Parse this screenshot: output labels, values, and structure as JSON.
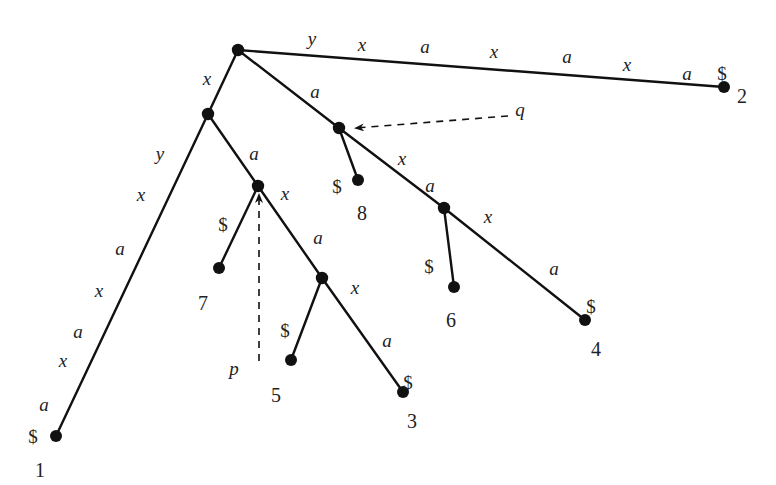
{
  "diagram": {
    "type": "suffix-tree",
    "string": "xaxaxa$ / yxaxaxa$",
    "nodes": [
      {
        "id": "root",
        "x": 238,
        "y": 50,
        "kind": "internal"
      },
      {
        "id": "nx",
        "x": 208,
        "y": 114,
        "kind": "internal"
      },
      {
        "id": "q",
        "x": 339,
        "y": 128,
        "kind": "internal"
      },
      {
        "id": "p",
        "x": 258,
        "y": 186,
        "kind": "internal"
      },
      {
        "id": "nxaxa",
        "x": 322,
        "y": 278,
        "kind": "internal"
      },
      {
        "id": "naxa",
        "x": 444,
        "y": 208,
        "kind": "internal"
      },
      {
        "id": "leaf1",
        "x": 56,
        "y": 436,
        "kind": "leaf",
        "label": "1",
        "lx": 40,
        "ly": 470
      },
      {
        "id": "leaf2",
        "x": 724,
        "y": 87,
        "kind": "leaf",
        "label": "2",
        "lx": 742,
        "ly": 96
      },
      {
        "id": "leaf3",
        "x": 403,
        "y": 392,
        "kind": "leaf",
        "label": "3",
        "lx": 412,
        "ly": 421
      },
      {
        "id": "leaf4",
        "x": 585,
        "y": 320,
        "kind": "leaf",
        "label": "4",
        "lx": 596,
        "ly": 349
      },
      {
        "id": "leaf5",
        "x": 291,
        "y": 360,
        "kind": "leaf",
        "label": "5",
        "lx": 276,
        "ly": 395
      },
      {
        "id": "leaf6",
        "x": 454,
        "y": 287,
        "kind": "leaf",
        "label": "6",
        "lx": 451,
        "ly": 320
      },
      {
        "id": "leaf7",
        "x": 219,
        "y": 268,
        "kind": "leaf",
        "label": "7",
        "lx": 203,
        "ly": 303
      },
      {
        "id": "leaf8",
        "x": 358,
        "y": 180,
        "kind": "leaf",
        "label": "8",
        "lx": 362,
        "ly": 213
      }
    ],
    "edges": [
      {
        "from": "root",
        "to": "nx",
        "label": "x"
      },
      {
        "from": "root",
        "to": "leaf2",
        "label": "yxaxaxa$"
      },
      {
        "from": "root",
        "to": "q",
        "label": "a"
      },
      {
        "from": "nx",
        "to": "leaf1",
        "label": "yxaxaxa$"
      },
      {
        "from": "nx",
        "to": "p",
        "label": "a"
      },
      {
        "from": "p",
        "to": "leaf7",
        "label": "$"
      },
      {
        "from": "p",
        "to": "nxaxa",
        "label": "xa"
      },
      {
        "from": "nxaxa",
        "to": "leaf5",
        "label": "$"
      },
      {
        "from": "nxaxa",
        "to": "leaf3",
        "label": "xa$"
      },
      {
        "from": "q",
        "to": "leaf8",
        "label": "$"
      },
      {
        "from": "q",
        "to": "naxa",
        "label": "xa"
      },
      {
        "from": "naxa",
        "to": "leaf6",
        "label": "$"
      },
      {
        "from": "naxa",
        "to": "leaf4",
        "label": "xa$"
      }
    ],
    "edge_chars": [
      {
        "t": "y",
        "x": 312,
        "y": 38,
        "style": "it"
      },
      {
        "t": "x",
        "x": 362,
        "y": 44,
        "style": "it"
      },
      {
        "t": "a",
        "x": 425,
        "y": 46,
        "style": "it"
      },
      {
        "t": "x",
        "x": 494,
        "y": 51,
        "style": "it"
      },
      {
        "t": "a",
        "x": 567,
        "y": 56,
        "style": "it"
      },
      {
        "t": "x",
        "x": 627,
        "y": 64,
        "style": "it"
      },
      {
        "t": "a",
        "x": 687,
        "y": 73,
        "style": "it"
      },
      {
        "t": "$",
        "x": 722,
        "y": 73,
        "style": "rm"
      },
      {
        "t": "x",
        "x": 207,
        "y": 78,
        "style": "it"
      },
      {
        "t": "a",
        "x": 315,
        "y": 91,
        "style": "it"
      },
      {
        "t": "y",
        "x": 160,
        "y": 153,
        "style": "it"
      },
      {
        "t": "x",
        "x": 141,
        "y": 194,
        "style": "it"
      },
      {
        "t": "a",
        "x": 120,
        "y": 248,
        "style": "it"
      },
      {
        "t": "x",
        "x": 99,
        "y": 290,
        "style": "it"
      },
      {
        "t": "a",
        "x": 78,
        "y": 331,
        "style": "it"
      },
      {
        "t": "x",
        "x": 63,
        "y": 360,
        "style": "it"
      },
      {
        "t": "a",
        "x": 44,
        "y": 404,
        "style": "it"
      },
      {
        "t": "$",
        "x": 33,
        "y": 436,
        "style": "rm"
      },
      {
        "t": "a",
        "x": 254,
        "y": 153,
        "style": "it"
      },
      {
        "t": "x",
        "x": 285,
        "y": 193,
        "style": "it"
      },
      {
        "t": "$",
        "x": 223,
        "y": 224,
        "style": "rm"
      },
      {
        "t": "a",
        "x": 318,
        "y": 237,
        "style": "it"
      },
      {
        "t": "x",
        "x": 355,
        "y": 287,
        "style": "it"
      },
      {
        "t": "$",
        "x": 285,
        "y": 330,
        "style": "rm"
      },
      {
        "t": "a",
        "x": 387,
        "y": 340,
        "style": "it"
      },
      {
        "t": "$",
        "x": 408,
        "y": 382,
        "style": "rm"
      },
      {
        "t": "$",
        "x": 337,
        "y": 186,
        "style": "rm"
      },
      {
        "t": "x",
        "x": 402,
        "y": 158,
        "style": "it"
      },
      {
        "t": "a",
        "x": 430,
        "y": 185,
        "style": "it"
      },
      {
        "t": "x",
        "x": 488,
        "y": 216,
        "style": "it"
      },
      {
        "t": "$",
        "x": 429,
        "y": 266,
        "style": "rm"
      },
      {
        "t": "a",
        "x": 554,
        "y": 268,
        "style": "it"
      },
      {
        "t": "$",
        "x": 591,
        "y": 306,
        "style": "rm"
      }
    ],
    "pointers": [
      {
        "name": "q",
        "label": "q",
        "lx": 520,
        "ly": 109,
        "x1": 508,
        "y1": 116,
        "x2": 356,
        "y2": 128
      },
      {
        "name": "p",
        "label": "p",
        "lx": 234,
        "ly": 368,
        "x1": 259,
        "y1": 361,
        "x2": 259,
        "y2": 195
      }
    ]
  }
}
